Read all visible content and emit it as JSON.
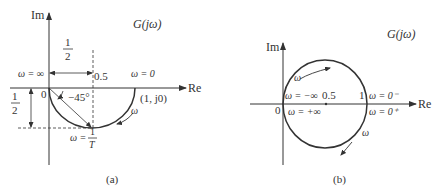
{
  "figure_a": {
    "caption": "(a)",
    "function_label": "G(jω)",
    "axis_im": "Im",
    "axis_re": "Re",
    "origin_label": "0",
    "half_top_num": "1",
    "half_top_den": "2",
    "half_left_num": "1",
    "half_left_den": "2",
    "label_half_mark": "0.5",
    "omega_inf": "ω = ∞",
    "omega_zero": "ω = 0",
    "angle": "−45°",
    "point_one": "(1, j0)",
    "omega_dir": "ω",
    "omega_T_lhs": "ω =",
    "omega_T_num": "1",
    "omega_T_den": "T"
  },
  "figure_b": {
    "caption": "(b)",
    "function_label": "G(jω)",
    "axis_im": "Im",
    "axis_re": "Re",
    "origin_label": "0",
    "center_label": "0.5",
    "one_label": "1",
    "omega_neg_inf": "ω = −∞",
    "omega_pos_inf": "ω = +∞",
    "omega_zero_minus": "ω = 0⁻",
    "omega_zero_plus": "ω = 0⁺",
    "omega_dir_top": "ω",
    "omega_dir_right": "ω"
  },
  "colors": {
    "stroke": "#333333",
    "text": "#333333",
    "background": "#ffffff"
  }
}
